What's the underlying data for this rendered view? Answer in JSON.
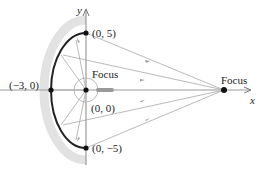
{
  "diagram": {
    "axes": {
      "x_label": "x",
      "y_label": "y"
    },
    "points": [
      {
        "name": "top-vertex",
        "label": "(0, 5)"
      },
      {
        "name": "left-vertex",
        "label": "(−3, 0)"
      },
      {
        "name": "origin",
        "label": "(0, 0)"
      },
      {
        "name": "bottom-vertex",
        "label": "(0, −5)"
      }
    ],
    "focus_labels": {
      "left": "Focus",
      "right": "Focus"
    },
    "colors": {
      "curve": "#222222",
      "rays": "#a0a0a0",
      "axes": "#909090",
      "band": "#dddddd"
    }
  }
}
